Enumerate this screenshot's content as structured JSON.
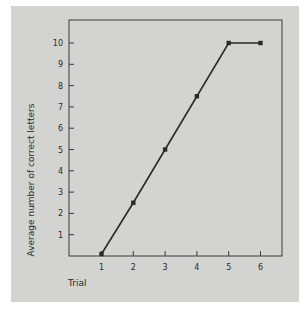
{
  "chart_data": {
    "type": "line",
    "title": "",
    "xlabel": "Trial",
    "ylabel": "Average number of correct letters",
    "categories": [
      1,
      2,
      3,
      4,
      5,
      6
    ],
    "x": [
      1,
      2,
      3,
      4,
      5,
      6
    ],
    "values": [
      0,
      2.5,
      5,
      7.5,
      10,
      10
    ],
    "series": [
      {
        "name": "Average correct letters",
        "values": [
          0,
          2.5,
          5,
          7.5,
          10,
          10
        ]
      }
    ],
    "xticks": [
      "1",
      "2",
      "3",
      "4",
      "5",
      "6"
    ],
    "yticks": [
      "1",
      "2",
      "3",
      "4",
      "5",
      "6",
      "7",
      "8",
      "9",
      "10"
    ],
    "xlim": [
      0,
      6.4
    ],
    "ylim": [
      0,
      11
    ],
    "grid": false,
    "legend": null,
    "colors": {
      "panel_background": "#d3d3d1",
      "line": "#2a2a2a",
      "axes": "#3a3a3a",
      "page_background": "#ffffff"
    }
  }
}
